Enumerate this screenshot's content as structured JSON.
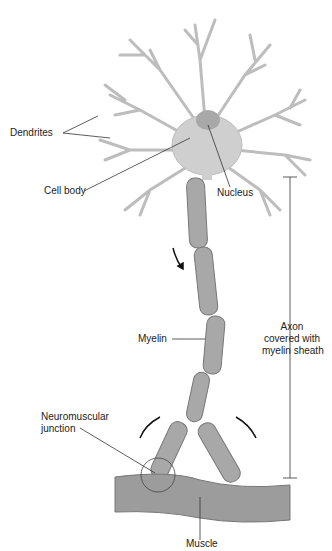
{
  "diagram": {
    "labels": {
      "dendrites": "Dendrites",
      "cell_body": "Cell body",
      "nucleus": "Nucleus",
      "myelin": "Myelin",
      "axon_line1": "Axon",
      "axon_line2": "covered with",
      "axon_line3": "myelin sheath",
      "neuromuscular_line1": "Neuromuscular",
      "neuromuscular_line2": "junction",
      "muscle": "Muscle"
    },
    "colors": {
      "cell": "#cfcfcf",
      "cell_stroke": "#9a9a9a",
      "myelin": "#a8a8a8",
      "muscle": "#9c9c9c",
      "line": "#333333"
    }
  }
}
